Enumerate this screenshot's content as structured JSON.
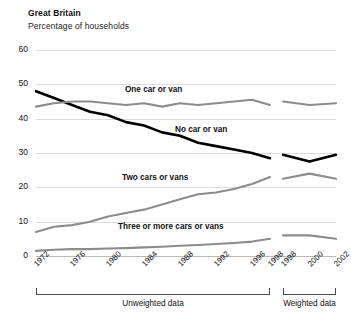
{
  "header": {
    "title": "Great Britain",
    "subtitle": "Percentage of households"
  },
  "footer": {
    "unweighted_caption": "Unweighted data",
    "weighted_caption": "Weighted data"
  },
  "colors": {
    "no_car": "#000000",
    "other_series": "#8c8c8c",
    "grid": "#dcdcdc",
    "axis": "#4a4a4a"
  },
  "chart_data": {
    "type": "line",
    "title": "Great Britain",
    "subtitle": "Percentage of households",
    "xlabel": "",
    "ylabel": "",
    "ylim": [
      0,
      60
    ],
    "yticks": [
      0,
      10,
      20,
      30,
      40,
      50,
      60
    ],
    "grid": true,
    "legend": "inline-labels",
    "panels": [
      {
        "name": "Unweighted data",
        "x": [
          1972,
          1974,
          1976,
          1978,
          1980,
          1982,
          1984,
          1986,
          1988,
          1990,
          1992,
          1994,
          1996,
          1998
        ],
        "xticks": [
          1972,
          1976,
          1980,
          1984,
          1988,
          1992,
          1996,
          1998
        ],
        "series": [
          {
            "name": "No car or van",
            "color": "#000000",
            "values": [
              48,
              46,
              44,
              42,
              41,
              39,
              38,
              36,
              35,
              33,
              32,
              31,
              30,
              28.5
            ]
          },
          {
            "name": "One car or van",
            "color": "#8c8c8c",
            "values": [
              43.5,
              44.5,
              45,
              45,
              44.5,
              44,
              44.5,
              43.5,
              44.5,
              44,
              44.5,
              45,
              45.5,
              44
            ]
          },
          {
            "name": "Two cars or vans",
            "color": "#8c8c8c",
            "values": [
              7,
              8.5,
              9,
              10,
              11.5,
              12.5,
              13.5,
              15,
              16.5,
              18,
              18.5,
              19.5,
              21,
              23
            ]
          },
          {
            "name": "Three or more cars or vans",
            "color": "#8c8c8c",
            "values": [
              1.5,
              1.8,
              2,
              2,
              2.2,
              2.3,
              2.5,
              2.7,
              3,
              3.2,
              3.5,
              3.8,
              4.2,
              5
            ]
          }
        ]
      },
      {
        "name": "Weighted data",
        "x": [
          1998,
          2000,
          2002
        ],
        "xticks": [
          1998,
          2000,
          2002
        ],
        "series": [
          {
            "name": "No car or van",
            "color": "#000000",
            "values": [
              29.5,
              27.5,
              29.5
            ]
          },
          {
            "name": "One car or van",
            "color": "#8c8c8c",
            "values": [
              45,
              44,
              44.5
            ]
          },
          {
            "name": "Two cars or vans",
            "color": "#8c8c8c",
            "values": [
              22.5,
              24,
              22.5
            ]
          },
          {
            "name": "Three or more cars or vans",
            "color": "#8c8c8c",
            "values": [
              6,
              6,
              5
            ]
          }
        ]
      }
    ],
    "series_labels": [
      {
        "text": "One car or van",
        "left": 125,
        "top": 85
      },
      {
        "text": "No car or van",
        "left": 175,
        "top": 125
      },
      {
        "text": "Two cars or vans",
        "left": 122,
        "top": 173
      },
      {
        "text": "Three or more cars or vans",
        "left": 118,
        "top": 222
      }
    ]
  }
}
